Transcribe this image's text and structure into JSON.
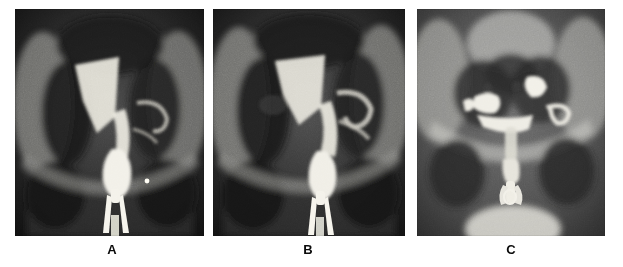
{
  "figure": {
    "kind": "radiograph-panel-figure",
    "modality": "hysterosalpingogram",
    "background_color": "#ffffff",
    "width": 623,
    "height": 267,
    "panel_count": 3
  },
  "panels": [
    {
      "id": "panel-a",
      "label": "A",
      "label_x": 112,
      "label_y": 243,
      "x": 15,
      "y": 9,
      "w": 189,
      "h": 227,
      "film_base_color": "#2a2a2a",
      "contrast_color": "#f2f0e8",
      "bone_color": "#9a9a96",
      "caption_alt": "Antero-posterior pelvic radiograph showing contrast-filled uterine cavity with a triangular filling defect and metallic cannula in the vagina",
      "features": [
        {
          "name": "uterine-cavity-contrast",
          "cx": 0.52,
          "cy": 0.45
        },
        {
          "name": "triangular-filling-defect",
          "cx": 0.42,
          "cy": 0.28
        },
        {
          "name": "cervical-canal",
          "cx": 0.52,
          "cy": 0.63
        },
        {
          "name": "metallic-cannula",
          "cx": 0.52,
          "cy": 0.8
        },
        {
          "name": "iliac-bone-left",
          "cx": 0.18,
          "cy": 0.45
        },
        {
          "name": "iliac-bone-right",
          "cx": 0.86,
          "cy": 0.45
        },
        {
          "name": "radiopaque-marker-dot",
          "cx": 0.7,
          "cy": 0.76
        }
      ]
    },
    {
      "id": "panel-b",
      "label": "B",
      "label_x": 308,
      "label_y": 243,
      "x": 213,
      "y": 9,
      "w": 192,
      "h": 227,
      "film_base_color": "#2e2e2e",
      "contrast_color": "#f0eee6",
      "bone_color": "#9d9d99",
      "caption_alt": "Antero-posterior pelvic radiograph with contrast outlining the uterine cavity, contrast extending laterally into the right tubal region, and metallic cannula in place",
      "features": [
        {
          "name": "uterine-cavity-contrast",
          "cx": 0.56,
          "cy": 0.44
        },
        {
          "name": "triangular-filling-defect",
          "cx": 0.44,
          "cy": 0.26
        },
        {
          "name": "tubal-contrast-right",
          "cx": 0.74,
          "cy": 0.4
        },
        {
          "name": "cervical-canal",
          "cx": 0.55,
          "cy": 0.64
        },
        {
          "name": "metallic-cannula",
          "cx": 0.55,
          "cy": 0.82
        },
        {
          "name": "iliac-bone-left",
          "cx": 0.16,
          "cy": 0.44
        },
        {
          "name": "iliac-bone-right",
          "cx": 0.88,
          "cy": 0.42
        }
      ]
    },
    {
      "id": "panel-c",
      "label": "C",
      "label_x": 511,
      "label_y": 243,
      "x": 417,
      "y": 9,
      "w": 188,
      "h": 227,
      "film_base_color": "#4a4a4a",
      "contrast_color": "#f4f2ea",
      "bone_color": "#b8b8b4",
      "caption_alt": "Antero-posterior pelvic radiograph showing bilateral loculated contrast collections in the adnexal regions with contrast in the vagina and cannula",
      "features": [
        {
          "name": "sacral-vertebrae",
          "cx": 0.5,
          "cy": 0.12
        },
        {
          "name": "contrast-collection-left",
          "cx": 0.38,
          "cy": 0.42
        },
        {
          "name": "contrast-collection-right",
          "cx": 0.64,
          "cy": 0.36
        },
        {
          "name": "tubal-contrast-right",
          "cx": 0.78,
          "cy": 0.47
        },
        {
          "name": "cervical-contrast",
          "cx": 0.5,
          "cy": 0.55
        },
        {
          "name": "vaginal-contrast",
          "cx": 0.5,
          "cy": 0.72
        },
        {
          "name": "cannula",
          "cx": 0.5,
          "cy": 0.84
        },
        {
          "name": "obturator-foramen-left",
          "cx": 0.22,
          "cy": 0.68
        },
        {
          "name": "obturator-foramen-right",
          "cx": 0.8,
          "cy": 0.68
        },
        {
          "name": "bright-dome-artifact",
          "cx": 0.58,
          "cy": 0.95
        }
      ]
    }
  ]
}
